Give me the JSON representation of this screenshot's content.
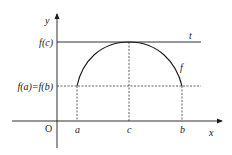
{
  "diagram": {
    "axes": {
      "x_label": "x",
      "y_label": "y",
      "origin_label": "O"
    },
    "x_ticks": [
      {
        "key": "a",
        "label": "a"
      },
      {
        "key": "c",
        "label": "c"
      },
      {
        "key": "b",
        "label": "b"
      }
    ],
    "y_ticks": [
      {
        "key": "fc",
        "label": "f(c)"
      },
      {
        "key": "fa",
        "label": "f(a)=f(b)"
      }
    ],
    "curve_label": "f",
    "tangent_label": "t",
    "colors": {
      "stroke": "#1a1a1a",
      "background": "#ffffff"
    }
  }
}
